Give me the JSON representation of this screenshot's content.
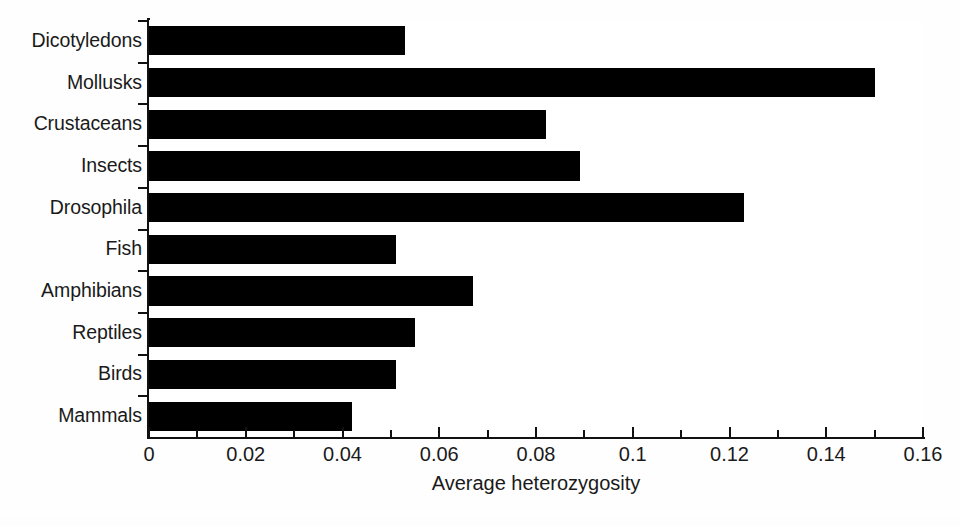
{
  "chart_data": {
    "type": "bar",
    "orientation": "horizontal",
    "title": "",
    "xlabel": "Average heterozygosity",
    "ylabel": "",
    "categories": [
      "Dicotyledons",
      "Mollusks",
      "Crustaceans",
      "Insects",
      "Drosophila",
      "Fish",
      "Amphibians",
      "Reptiles",
      "Birds",
      "Mammals"
    ],
    "values": [
      0.053,
      0.15,
      0.082,
      0.089,
      0.123,
      0.051,
      0.067,
      0.055,
      0.051,
      0.042
    ],
    "xlim": [
      0,
      0.16
    ],
    "xticks": [
      0,
      0.02,
      0.04,
      0.06,
      0.08,
      0.1,
      0.12,
      0.14,
      0.16
    ],
    "xtick_labels": [
      "0",
      "0.02",
      "0.04",
      "0.06",
      "0.08",
      "0.1",
      "0.12",
      "0.14",
      "0.16"
    ],
    "xminor_ticks": [
      0.01,
      0.03,
      0.05,
      0.07,
      0.09,
      0.11,
      0.13,
      0.15
    ],
    "grid": false,
    "legend": false,
    "bar_color": "#000000",
    "background_color": "#ffffff",
    "axis_color": "#111111"
  }
}
